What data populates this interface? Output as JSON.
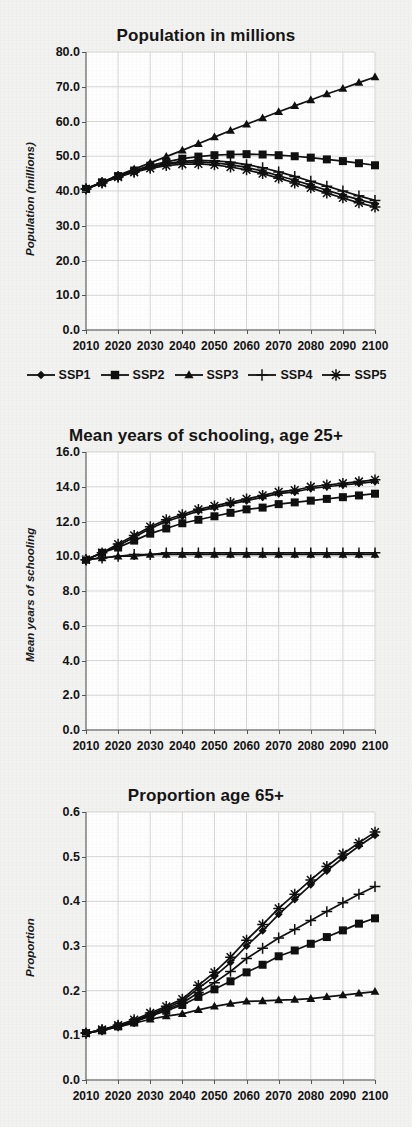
{
  "figure": {
    "background_color": "#f2f2f0",
    "plot_background_color": "#fefefe",
    "line_color": "#101010",
    "grid_color": "#d7d7d7"
  },
  "legend": {
    "position": "below-first-chart",
    "entries": [
      {
        "label": "SSP1",
        "marker": "diamond"
      },
      {
        "label": "SSP2",
        "marker": "square"
      },
      {
        "label": "SSP3",
        "marker": "triangle"
      },
      {
        "label": "SSP4",
        "marker": "plus"
      },
      {
        "label": "SSP5",
        "marker": "asterisk"
      }
    ]
  },
  "chart_data": [
    {
      "type": "line",
      "title": "Population in millions",
      "xlabel": "",
      "ylabel": "Population (millions)",
      "x": [
        2010,
        2015,
        2020,
        2025,
        2030,
        2035,
        2040,
        2045,
        2050,
        2055,
        2060,
        2065,
        2070,
        2075,
        2080,
        2085,
        2090,
        2095,
        2100
      ],
      "xlim": [
        2010,
        2100
      ],
      "xticks": [
        2010,
        2020,
        2030,
        2040,
        2050,
        2060,
        2070,
        2080,
        2090,
        2100
      ],
      "ylim": [
        0.0,
        80.0
      ],
      "yticks": [
        "0.0",
        "10.0",
        "20.0",
        "30.0",
        "40.0",
        "50.0",
        "60.0",
        "70.0",
        "80.0"
      ],
      "grid": true,
      "series": [
        {
          "name": "SSP1",
          "marker": "diamond",
          "values": [
            40.6,
            42.4,
            44.1,
            45.6,
            46.8,
            47.7,
            48.2,
            48.4,
            48.1,
            47.6,
            46.8,
            45.7,
            44.4,
            43.1,
            41.7,
            40.2,
            38.8,
            37.5,
            36.3
          ]
        },
        {
          "name": "SSP2",
          "marker": "square",
          "values": [
            40.6,
            42.5,
            44.3,
            45.9,
            47.3,
            48.4,
            49.3,
            49.9,
            50.3,
            50.5,
            50.6,
            50.5,
            50.3,
            50.0,
            49.6,
            49.1,
            48.6,
            48.0,
            47.4
          ]
        },
        {
          "name": "SSP3",
          "marker": "triangle",
          "values": [
            40.6,
            42.6,
            44.5,
            46.3,
            48.1,
            49.9,
            51.7,
            53.6,
            55.5,
            57.4,
            59.2,
            61.0,
            62.8,
            64.5,
            66.2,
            67.9,
            69.5,
            71.2,
            72.8
          ]
        },
        {
          "name": "SSP4",
          "marker": "plus",
          "values": [
            40.6,
            42.4,
            44.1,
            45.6,
            46.9,
            47.9,
            48.5,
            48.8,
            48.7,
            48.3,
            47.6,
            46.7,
            45.5,
            44.2,
            42.8,
            41.4,
            40.0,
            38.6,
            37.3
          ]
        },
        {
          "name": "SSP5",
          "marker": "asterisk",
          "values": [
            40.6,
            42.3,
            44.0,
            45.4,
            46.5,
            47.3,
            47.7,
            47.8,
            47.5,
            46.9,
            46.1,
            45.0,
            43.7,
            42.3,
            40.9,
            39.4,
            38.0,
            36.6,
            35.4
          ]
        }
      ]
    },
    {
      "type": "line",
      "title": "Mean years of schooling, age 25+",
      "xlabel": "",
      "ylabel": "Mean years of schooling",
      "x": [
        2010,
        2015,
        2020,
        2025,
        2030,
        2035,
        2040,
        2045,
        2050,
        2055,
        2060,
        2065,
        2070,
        2075,
        2080,
        2085,
        2090,
        2095,
        2100
      ],
      "xlim": [
        2010,
        2100
      ],
      "xticks": [
        2010,
        2020,
        2030,
        2040,
        2050,
        2060,
        2070,
        2080,
        2090,
        2100
      ],
      "ylim": [
        0.0,
        16.0
      ],
      "yticks": [
        "0.0",
        "2.0",
        "4.0",
        "6.0",
        "8.0",
        "10.0",
        "12.0",
        "14.0",
        "16.0"
      ],
      "grid": true,
      "series": [
        {
          "name": "SSP1",
          "marker": "diamond",
          "values": [
            9.8,
            10.2,
            10.6,
            11.1,
            11.6,
            12.0,
            12.3,
            12.6,
            12.8,
            13.0,
            13.2,
            13.4,
            13.6,
            13.7,
            13.9,
            14.0,
            14.1,
            14.2,
            14.3
          ]
        },
        {
          "name": "SSP2",
          "marker": "square",
          "values": [
            9.8,
            10.2,
            10.5,
            10.9,
            11.3,
            11.6,
            11.9,
            12.1,
            12.3,
            12.5,
            12.7,
            12.8,
            13.0,
            13.1,
            13.2,
            13.3,
            13.4,
            13.5,
            13.6
          ]
        },
        {
          "name": "SSP3",
          "marker": "triangle",
          "values": [
            9.8,
            9.9,
            10.0,
            10.0,
            10.1,
            10.1,
            10.1,
            10.1,
            10.1,
            10.1,
            10.1,
            10.1,
            10.1,
            10.1,
            10.1,
            10.1,
            10.1,
            10.1,
            10.1
          ]
        },
        {
          "name": "SSP4",
          "marker": "plus",
          "values": [
            9.8,
            9.9,
            10.0,
            10.1,
            10.1,
            10.2,
            10.2,
            10.2,
            10.2,
            10.2,
            10.2,
            10.2,
            10.2,
            10.2,
            10.2,
            10.2,
            10.2,
            10.2,
            10.2
          ]
        },
        {
          "name": "SSP5",
          "marker": "asterisk",
          "values": [
            9.8,
            10.2,
            10.7,
            11.2,
            11.7,
            12.1,
            12.4,
            12.7,
            12.9,
            13.1,
            13.3,
            13.5,
            13.7,
            13.8,
            14.0,
            14.1,
            14.2,
            14.3,
            14.4
          ]
        }
      ]
    },
    {
      "type": "line",
      "title": "Proportion age 65+",
      "xlabel": "",
      "ylabel": "Proportion",
      "x": [
        2010,
        2015,
        2020,
        2025,
        2030,
        2035,
        2040,
        2045,
        2050,
        2055,
        2060,
        2065,
        2070,
        2075,
        2080,
        2085,
        2090,
        2095,
        2100
      ],
      "xlim": [
        2010,
        2100
      ],
      "xticks": [
        2010,
        2020,
        2030,
        2040,
        2050,
        2060,
        2070,
        2080,
        2090,
        2100
      ],
      "ylim": [
        0.0,
        0.6
      ],
      "yticks": [
        "0.0",
        "0.1",
        "0.2",
        "0.3",
        "0.4",
        "0.5",
        "0.6"
      ],
      "grid": true,
      "series": [
        {
          "name": "SSP1",
          "marker": "diamond",
          "values": [
            0.105,
            0.112,
            0.122,
            0.133,
            0.147,
            0.161,
            0.177,
            0.205,
            0.232,
            0.263,
            0.3,
            0.334,
            0.371,
            0.404,
            0.437,
            0.468,
            0.497,
            0.524,
            0.548
          ]
        },
        {
          "name": "SSP2",
          "marker": "square",
          "values": [
            0.105,
            0.111,
            0.12,
            0.13,
            0.143,
            0.155,
            0.168,
            0.186,
            0.203,
            0.221,
            0.241,
            0.258,
            0.277,
            0.29,
            0.305,
            0.32,
            0.335,
            0.35,
            0.362
          ]
        },
        {
          "name": "SSP3",
          "marker": "triangle",
          "values": [
            0.105,
            0.111,
            0.119,
            0.127,
            0.136,
            0.143,
            0.148,
            0.157,
            0.165,
            0.171,
            0.176,
            0.177,
            0.179,
            0.18,
            0.182,
            0.186,
            0.19,
            0.194,
            0.198
          ]
        },
        {
          "name": "SSP4",
          "marker": "plus",
          "values": [
            0.105,
            0.112,
            0.121,
            0.131,
            0.145,
            0.158,
            0.172,
            0.196,
            0.218,
            0.243,
            0.272,
            0.295,
            0.318,
            0.337,
            0.357,
            0.377,
            0.397,
            0.416,
            0.433
          ]
        },
        {
          "name": "SSP5",
          "marker": "asterisk",
          "values": [
            0.105,
            0.113,
            0.123,
            0.135,
            0.15,
            0.165,
            0.181,
            0.212,
            0.241,
            0.275,
            0.313,
            0.348,
            0.384,
            0.416,
            0.448,
            0.478,
            0.506,
            0.531,
            0.555
          ]
        }
      ]
    }
  ]
}
